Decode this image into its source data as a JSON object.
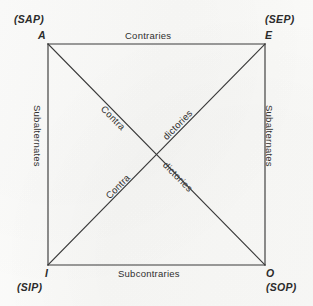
{
  "diagram": {
    "colors": {
      "background": "#fbfbfa",
      "line": "#3a3a3a",
      "text": "#2b2b2b"
    },
    "corners": [
      {
        "id": "A",
        "letter": "A",
        "form": "(SAP)",
        "position": "top-left"
      },
      {
        "id": "E",
        "letter": "E",
        "form": "(SEP)",
        "position": "top-right"
      },
      {
        "id": "I",
        "letter": "I",
        "form": "(SIP)",
        "position": "bottom-left"
      },
      {
        "id": "O",
        "letter": "O",
        "form": "(SOP)",
        "position": "bottom-right"
      }
    ],
    "edges": {
      "top": "Contraries",
      "bottom": "Subcontraries",
      "left": "Subalternates",
      "right": "Subalternates"
    },
    "diagonals": {
      "upper_left_segment": "Contra",
      "upper_right_segment": "dictories",
      "lower_left_segment": "Contra",
      "lower_right_segment": "dictories"
    }
  },
  "geometry": {
    "square": {
      "left": 48,
      "top": 44,
      "right": 265,
      "bottom": 265
    }
  }
}
